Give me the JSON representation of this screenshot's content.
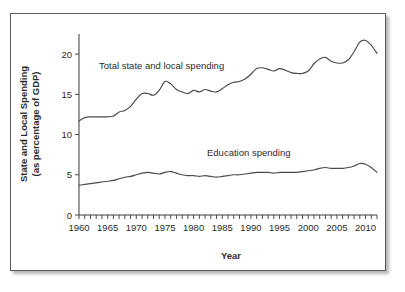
{
  "chart_data": {
    "type": "line",
    "title": "",
    "xlabel": "Year",
    "ylabel": "State and Local Spending (as percentage of GDP)",
    "ylabel_line1": "State and Local Spending",
    "ylabel_line2": "(as percentage of GDP)",
    "xlim": [
      1960,
      2012
    ],
    "ylim": [
      0,
      22.5
    ],
    "yticks": [
      0,
      5,
      10,
      15,
      20
    ],
    "ytick_labels": [
      "0",
      "5",
      "10",
      "15",
      "20"
    ],
    "xticks_labeled": [
      1960,
      1965,
      1970,
      1975,
      1980,
      1985,
      1990,
      1995,
      2000,
      2005,
      2010
    ],
    "xtick_labels": [
      "1960",
      "1965",
      "1970",
      "1975",
      "1980",
      "1985",
      "1990",
      "1995",
      "2000",
      "2005",
      "2010"
    ],
    "xtick_minor_step": 1,
    "grid": false,
    "legend_position": "inline-annotations",
    "x": [
      1960,
      1961,
      1962,
      1963,
      1964,
      1965,
      1966,
      1967,
      1968,
      1969,
      1970,
      1971,
      1972,
      1973,
      1974,
      1975,
      1976,
      1977,
      1978,
      1979,
      1980,
      1981,
      1982,
      1983,
      1984,
      1985,
      1986,
      1987,
      1988,
      1989,
      1990,
      1991,
      1992,
      1993,
      1994,
      1995,
      1996,
      1997,
      1998,
      1999,
      2000,
      2001,
      2002,
      2003,
      2004,
      2005,
      2006,
      2007,
      2008,
      2009,
      2010,
      2011,
      2012
    ],
    "series": [
      {
        "name": "Total state and local spending",
        "annotation": "Total state and local spending",
        "values": [
          11.7,
          12.1,
          12.2,
          12.2,
          12.2,
          12.2,
          12.3,
          12.8,
          13.0,
          13.5,
          14.4,
          15.1,
          15.1,
          14.9,
          15.5,
          16.6,
          16.3,
          15.6,
          15.3,
          15.1,
          15.5,
          15.3,
          15.6,
          15.4,
          15.3,
          15.7,
          16.2,
          16.5,
          16.6,
          16.9,
          17.5,
          18.2,
          18.3,
          18.1,
          17.9,
          18.2,
          18.0,
          17.7,
          17.6,
          17.6,
          17.9,
          18.8,
          19.4,
          19.6,
          19.1,
          18.9,
          18.9,
          19.3,
          20.3,
          21.5,
          21.7,
          21.1,
          20.1
        ]
      },
      {
        "name": "Education spending",
        "annotation": "Education spending",
        "values": [
          3.7,
          3.8,
          3.9,
          4.0,
          4.1,
          4.2,
          4.3,
          4.5,
          4.7,
          4.8,
          5.0,
          5.2,
          5.3,
          5.2,
          5.1,
          5.3,
          5.4,
          5.2,
          5.0,
          4.9,
          4.9,
          4.8,
          4.9,
          4.8,
          4.7,
          4.8,
          4.9,
          5.0,
          5.0,
          5.1,
          5.2,
          5.3,
          5.3,
          5.3,
          5.2,
          5.3,
          5.3,
          5.3,
          5.3,
          5.4,
          5.5,
          5.6,
          5.8,
          5.9,
          5.8,
          5.8,
          5.8,
          5.9,
          6.1,
          6.4,
          6.3,
          5.9,
          5.3
        ]
      }
    ]
  },
  "annotations": {
    "total_label": "Total state and local spending",
    "education_label": "Education spending"
  }
}
